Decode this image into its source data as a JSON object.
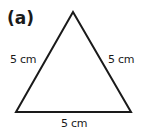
{
  "figure": {
    "part_label": "(a)",
    "shape": "equilateral-triangle",
    "sides": {
      "left": "5 cm",
      "right": "5 cm",
      "bottom": "5 cm"
    },
    "stroke_color": "#1a1a1a"
  }
}
